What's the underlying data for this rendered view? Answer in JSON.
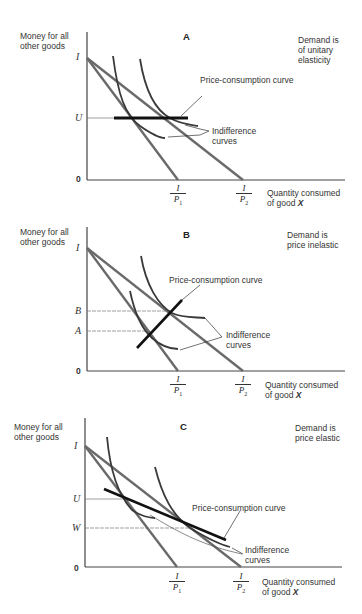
{
  "figure": {
    "panels": [
      {
        "id": "A",
        "title": "A",
        "note": [
          "Demand is",
          "of unitary",
          "elasticity"
        ],
        "y_axis_label": [
          "Money for all",
          "other goods"
        ],
        "x_axis_label": [
          "Quantity consumed",
          "of good "
        ],
        "x_axis_var": "X",
        "y_ticks": [
          "I",
          "U",
          "0"
        ],
        "x_ticks": [
          {
            "num": "I",
            "den": "P",
            "sub": "1"
          },
          {
            "num": "I",
            "den": "P",
            "sub": "2"
          }
        ],
        "curve_labels": {
          "pcc": "Price-consumption curve",
          "ic": [
            "Indifference",
            "curves"
          ]
        }
      },
      {
        "id": "B",
        "title": "B",
        "note": [
          "Demand is",
          "price inelastic"
        ],
        "y_axis_label": [
          "Money for all",
          "other goods"
        ],
        "x_axis_label": [
          "Quantity consumed",
          "of good "
        ],
        "x_axis_var": "X",
        "y_ticks": [
          "I",
          "B",
          "A",
          "0"
        ],
        "x_ticks": [
          {
            "num": "I",
            "den": "P",
            "sub": "1"
          },
          {
            "num": "I",
            "den": "P",
            "sub": "2"
          }
        ],
        "curve_labels": {
          "pcc": "Price-consumption curve",
          "ic": [
            "Indifference",
            "curves"
          ]
        }
      },
      {
        "id": "C",
        "title": "C",
        "note": [
          "Demand is",
          "price elastic"
        ],
        "y_axis_label": [
          "Money for all",
          "other goods"
        ],
        "x_axis_label": [
          "Quantity consumed",
          "of good "
        ],
        "x_axis_var": "X",
        "y_ticks": [
          "I",
          "U",
          "W",
          "0"
        ],
        "x_ticks": [
          {
            "num": "I",
            "den": "P",
            "sub": "1"
          },
          {
            "num": "I",
            "den": "P",
            "sub": "2"
          }
        ],
        "curve_labels": {
          "pcc": "Price-consumption curve",
          "ic": [
            "Indifference",
            "curves"
          ]
        }
      }
    ],
    "colors": {
      "budget_line": "#6a6a6a",
      "indifference": "#3a3a3a",
      "pcc": "#111111",
      "axis": "#444444",
      "guide": "#777777"
    }
  }
}
